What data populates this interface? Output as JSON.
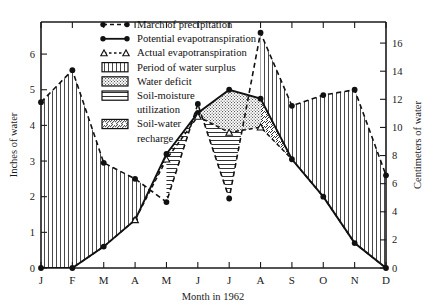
{
  "chart_data": {
    "type": "line",
    "title": "",
    "xlabel": "Month in 1962",
    "ylabel": "Inches of water",
    "ylabel_right": "Centimeters of water",
    "categories": [
      "J",
      "F",
      "M",
      "A",
      "M",
      "J",
      "J",
      "A",
      "S",
      "O",
      "N",
      "D"
    ],
    "month_labels": [
      "J",
      "F",
      "M",
      "A",
      "M",
      "J",
      "J",
      "A",
      "S",
      "O",
      "N",
      "D"
    ],
    "ylim": [
      0,
      6.9
    ],
    "yticks": [
      0,
      1,
      2,
      3,
      4,
      5,
      6
    ],
    "ytick_labels": [
      "0",
      "1",
      "2",
      "3",
      "4",
      "5",
      "6"
    ],
    "ylim_right": [
      0,
      17.5
    ],
    "yticks_right": [
      0,
      2,
      4,
      6,
      8,
      10,
      12,
      14,
      16
    ],
    "ytick_labels_right": [
      "0",
      "2",
      "4",
      "6",
      "8",
      "10",
      "12",
      "14",
      "16"
    ],
    "grid": false,
    "legend_position": "top-center",
    "series": [
      {
        "name": "March of precipitation",
        "key": "precipitation",
        "style": "dashed-line-filled-circles",
        "values": [
          4.65,
          5.55,
          2.95,
          2.5,
          1.85,
          4.6,
          1.95,
          6.6,
          4.55,
          4.85,
          5.0,
          2.6
        ]
      },
      {
        "name": "Potential evapotranspiration",
        "key": "potential_evapotranspiration",
        "style": "solid-line-filled-circles",
        "values": [
          0.0,
          0.0,
          0.6,
          1.35,
          3.2,
          4.35,
          5.0,
          4.75,
          3.05,
          2.0,
          0.7,
          0.0
        ]
      },
      {
        "name": "Actual evapotranspiration",
        "key": "actual_evapotranspiration",
        "style": "dashed-line-open-triangles",
        "values": [
          0.0,
          0.0,
          0.6,
          1.35,
          3.05,
          4.25,
          3.8,
          3.95,
          3.05,
          2.0,
          0.7,
          0.0
        ]
      }
    ],
    "annotations": [],
    "regions": [
      {
        "name": "Period of water surplus",
        "fill": "vertical-lines"
      },
      {
        "name": "Water deficit",
        "fill": "stipple-dots"
      },
      {
        "name": "Soil-moisture utilization",
        "fill": "horizontal-lines"
      },
      {
        "name": "Soil-water recharge",
        "fill": "diagonal-hatch"
      }
    ]
  },
  "legend": {
    "items": [
      {
        "label": "March of precipitation",
        "swatch": "dashed-line-filled-circles"
      },
      {
        "label": "Potential evapotranspiration",
        "swatch": "solid-line-filled-circles"
      },
      {
        "label": "Actual evapotranspiration",
        "swatch": "dashed-line-open-triangles"
      },
      {
        "label": "Period of water surplus",
        "swatch": "vertical-lines"
      },
      {
        "label": "Water deficit",
        "swatch": "stipple-dots"
      },
      {
        "label": "Soil-moisture",
        "label2": "utilization",
        "swatch": "horizontal-lines"
      },
      {
        "label": "Soil-water",
        "label2": "recharge",
        "swatch": "diagonal-hatch"
      }
    ]
  },
  "axes": {
    "left_title": "Inches of water",
    "right_title": "Centimeters of water",
    "bottom_title": "Month in 1962"
  },
  "colors": {
    "ink": "#111111",
    "background": "#ffffff",
    "frame": "#1a1a1a"
  }
}
